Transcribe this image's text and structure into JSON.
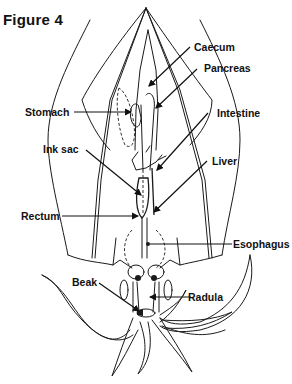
{
  "figure": {
    "title": "Figure 4",
    "labels": {
      "caecum": "Caecum",
      "pancreas": "Pancreas",
      "stomach": "Stomach",
      "intestine": "Intestine",
      "ink_sac": "Ink sac",
      "liver": "Liver",
      "rectum": "Rectum",
      "esophagus": "Esophagus",
      "beak": "Beak",
      "radula": "Radula"
    }
  }
}
